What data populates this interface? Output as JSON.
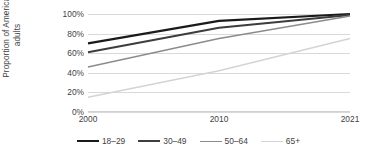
{
  "chart_data": {
    "type": "line",
    "title": "",
    "xlabel": "",
    "ylabel": "Proportion of American adults",
    "categories": [
      "2000",
      "2010",
      "2021"
    ],
    "x_tick_labels": [
      "2000",
      "2010",
      "2021"
    ],
    "y_tick_labels": [
      "0%",
      "20%",
      "40%",
      "60%",
      "80%",
      "100%"
    ],
    "y_tick_values": [
      0,
      20,
      40,
      60,
      80,
      100
    ],
    "ylim": [
      0,
      100
    ],
    "grid": "horizontal",
    "legend_position": "bottom",
    "series": [
      {
        "name": "18–29",
        "color": "#1a1a1a",
        "width": 2.2,
        "values": [
          70,
          93,
          100
        ]
      },
      {
        "name": "30–49",
        "color": "#3d3d3d",
        "width": 2.0,
        "values": [
          61,
          86,
          99
        ]
      },
      {
        "name": "50–64",
        "color": "#8c8c8c",
        "width": 1.6,
        "values": [
          46,
          75,
          98
        ]
      },
      {
        "name": "65+",
        "color": "#d4d4d4",
        "width": 1.6,
        "values": [
          15,
          42,
          75
        ]
      }
    ]
  },
  "axis": {
    "y_title": "Proportion of American adults"
  },
  "legend": {
    "items": [
      {
        "label": "18–29"
      },
      {
        "label": "30–49"
      },
      {
        "label": "50–64"
      },
      {
        "label": "65+"
      }
    ]
  },
  "colors": {
    "gridline": "#d9d9d9",
    "text": "#3f3f3f",
    "background": "#ffffff"
  }
}
